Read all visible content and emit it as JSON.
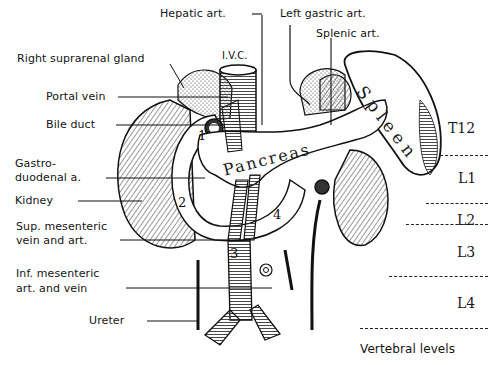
{
  "figure": {
    "type": "anatomical-illustration",
    "labels_left": [
      {
        "id": "right-suprarenal-gland",
        "text": "Right suprarenal gland"
      },
      {
        "id": "portal-vein",
        "text": "Portal vein"
      },
      {
        "id": "bile-duct",
        "text": "Bile duct"
      },
      {
        "id": "gastroduodenal-a",
        "text": "Gastro-\nduodenal a."
      },
      {
        "id": "kidney",
        "text": "Kidney"
      },
      {
        "id": "sup-mesenteric",
        "text": "Sup. mesenteric\nvein and art."
      },
      {
        "id": "inf-mesenteric",
        "text": "Inf. mesenteric\nart. and vein"
      },
      {
        "id": "ureter",
        "text": "Ureter"
      }
    ],
    "labels_top": [
      {
        "id": "hepatic-art",
        "text": "Hepatic art."
      },
      {
        "id": "ivc",
        "text": "I.V.C."
      },
      {
        "id": "left-gastric-art",
        "text": "Left gastric art."
      },
      {
        "id": "splenic-art",
        "text": "Splenic art."
      }
    ],
    "organ_labels": {
      "pancreas": "Pancreas",
      "spleen": "Spleen"
    },
    "duodenal_parts": [
      "1",
      "2",
      "3",
      "4"
    ],
    "vertebral_levels": {
      "title": "Vertebral levels",
      "levels": [
        "T12",
        "L1",
        "L2",
        "L3",
        "L4"
      ]
    }
  }
}
